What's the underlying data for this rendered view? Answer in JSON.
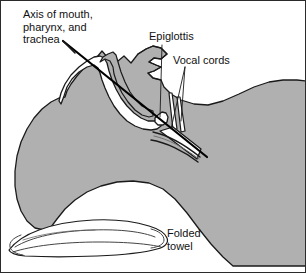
{
  "figure": {
    "width": 306,
    "height": 273,
    "background_color": "#ffffff",
    "border_color": "#2b2b2b"
  },
  "colors": {
    "tissue_gray": "#b0b0b0",
    "tissue_gray_light": "#bdbdbd",
    "outline": "#1a1a1a",
    "white_structure": "#ffffff",
    "text": "#111111",
    "leader_line": "#1a1a1a",
    "axis_line": "#000000"
  },
  "labels": {
    "axis": {
      "line1": "Axis of mouth,",
      "line2": "pharynx, and",
      "line3": "trachea"
    },
    "epiglottis": "Epiglottis",
    "vocal_cords": "Vocal cords",
    "towel": {
      "line1": "Folded",
      "line2": "towel"
    }
  },
  "structures": [
    {
      "name": "head-tissue",
      "fill": "#b0b0b0",
      "description": "Shaded soft tissue of head, face and neck in sagittal section"
    },
    {
      "name": "oral-cavity",
      "fill": "#ffffff",
      "description": "White open oral cavity and pharyngeal airway"
    },
    {
      "name": "tongue",
      "fill": "#b0b0b0",
      "description": "Tongue body within oral cavity"
    },
    {
      "name": "epiglottis-flap",
      "fill": "#ffffff",
      "description": "Small epiglottic flap above the larynx"
    },
    {
      "name": "vocal-cords",
      "fill": "#ffffff",
      "description": "Vocal cord pair at the laryngeal inlet"
    },
    {
      "name": "trachea",
      "fill": "#ffffff",
      "description": "Tracheal tube descending from larynx"
    },
    {
      "name": "folded-towel",
      "fill": "#ffffff",
      "description": "Folded towel supporting the occiput"
    }
  ]
}
